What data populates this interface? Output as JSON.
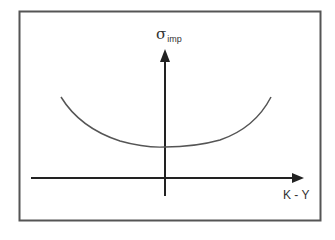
{
  "diagram": {
    "frame": {
      "stroke": "#555555"
    },
    "y_axis": {
      "symbol": "σ",
      "subscript": "imp"
    },
    "x_axis": {
      "label": "K - Y"
    },
    "curve": {
      "shape": "convex smile (U-shaped)",
      "stroke": "#555555"
    },
    "colors": {
      "axis": "#222222",
      "curve": "#555555",
      "text": "#333333"
    }
  }
}
